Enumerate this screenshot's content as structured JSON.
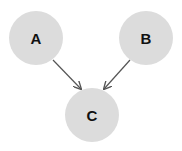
{
  "diagram": {
    "type": "directed-graph",
    "node_color": "#dcdcdc",
    "edge_color": "#555555",
    "nodes": [
      {
        "id": "A",
        "label": "A",
        "cx": 36,
        "cy": 38,
        "r": 27
      },
      {
        "id": "B",
        "label": "B",
        "cx": 146,
        "cy": 38,
        "r": 27
      },
      {
        "id": "C",
        "label": "C",
        "cx": 92,
        "cy": 115,
        "r": 27
      }
    ],
    "edges": [
      {
        "from": "A",
        "to": "C"
      },
      {
        "from": "B",
        "to": "C"
      }
    ]
  }
}
